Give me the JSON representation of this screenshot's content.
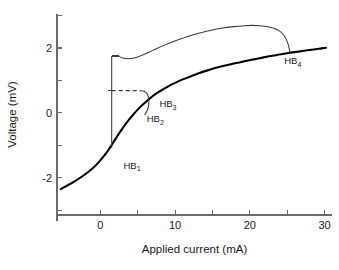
{
  "chart_data": {
    "type": "line",
    "title": "",
    "xlabel": "Applied current (mA)",
    "ylabel": "Voltage (mV)",
    "xlim": [
      -5.8,
      31.0
    ],
    "ylim": [
      -3.15,
      3.05
    ],
    "xticks": [
      0,
      5,
      10,
      15,
      20,
      25,
      30
    ],
    "xtick_labels": [
      "0",
      "",
      "10",
      "",
      "20",
      "",
      "30"
    ],
    "yticks": [
      -3,
      -2,
      -1,
      0,
      1,
      2,
      3
    ],
    "ytick_labels": [
      "",
      "-2",
      "",
      "0",
      "",
      "2",
      ""
    ],
    "grid": false,
    "legend": null,
    "series": [
      {
        "name": "steady-state branch",
        "style": "thick-solid",
        "points": [
          [
            -5.3,
            -2.35
          ],
          [
            -4.5,
            -2.25
          ],
          [
            -3.5,
            -2.12
          ],
          [
            -2.5,
            -1.97
          ],
          [
            -1.5,
            -1.8
          ],
          [
            -0.5,
            -1.59
          ],
          [
            0.3,
            -1.38
          ],
          [
            1.0,
            -1.17
          ],
          [
            1.6,
            -0.96
          ],
          [
            2.2,
            -0.74
          ],
          [
            2.9,
            -0.5
          ],
          [
            3.6,
            -0.28
          ],
          [
            4.3,
            -0.08
          ],
          [
            5.0,
            0.1
          ],
          [
            5.8,
            0.28
          ],
          [
            6.6,
            0.44
          ],
          [
            7.5,
            0.6
          ],
          [
            8.5,
            0.74
          ],
          [
            9.5,
            0.87
          ],
          [
            10.5,
            0.98
          ],
          [
            11.8,
            1.1
          ],
          [
            13.0,
            1.21
          ],
          [
            14.5,
            1.32
          ],
          [
            16.0,
            1.42
          ],
          [
            17.5,
            1.5
          ],
          [
            19.0,
            1.58
          ],
          [
            20.5,
            1.65
          ],
          [
            22.0,
            1.72
          ],
          [
            23.5,
            1.78
          ],
          [
            25.0,
            1.84
          ],
          [
            26.5,
            1.89
          ],
          [
            28.0,
            1.94
          ],
          [
            29.3,
            1.98
          ],
          [
            30.2,
            2.01
          ]
        ]
      },
      {
        "name": "upper periodic branch",
        "style": "thin-solid",
        "points": [
          [
            2.45,
            1.755
          ],
          [
            2.9,
            1.7
          ],
          [
            3.4,
            1.675
          ],
          [
            4.0,
            1.675
          ],
          [
            4.8,
            1.71
          ],
          [
            5.6,
            1.78
          ],
          [
            6.5,
            1.87
          ],
          [
            7.5,
            1.98
          ],
          [
            8.6,
            2.09
          ],
          [
            9.8,
            2.2
          ],
          [
            11.0,
            2.3
          ],
          [
            12.3,
            2.4
          ],
          [
            13.7,
            2.49
          ],
          [
            15.0,
            2.56
          ],
          [
            16.4,
            2.62
          ],
          [
            17.8,
            2.66
          ],
          [
            19.2,
            2.69
          ],
          [
            20.3,
            2.7
          ],
          [
            21.4,
            2.69
          ],
          [
            22.4,
            2.66
          ],
          [
            23.3,
            2.6
          ],
          [
            24.0,
            2.52
          ],
          [
            24.5,
            2.41
          ],
          [
            24.9,
            2.26
          ],
          [
            25.15,
            2.1
          ],
          [
            25.3,
            1.96
          ],
          [
            25.35,
            1.86
          ]
        ]
      },
      {
        "name": "lower periodic loop",
        "style": "thin-solid",
        "points": [
          [
            5.35,
            0.685
          ],
          [
            5.75,
            0.675
          ],
          [
            6.05,
            0.64
          ],
          [
            6.3,
            0.57
          ],
          [
            6.45,
            0.47
          ],
          [
            6.5,
            0.36
          ],
          [
            6.47,
            0.24
          ],
          [
            6.35,
            0.12
          ],
          [
            6.15,
            0.02
          ],
          [
            5.95,
            -0.06
          ]
        ]
      },
      {
        "name": "unstable vertical branch",
        "style": "vertical",
        "points": [
          [
            1.52,
            -1.08
          ],
          [
            1.52,
            1.755
          ]
        ]
      },
      {
        "name": "saddle-node dashed connector",
        "style": "dashed",
        "points": [
          [
            1.52,
            0.685
          ],
          [
            5.35,
            0.685
          ]
        ]
      }
    ],
    "stubs": [
      {
        "name": "upper-stub",
        "x0": 1.52,
        "x1": 2.45,
        "y": 1.755
      },
      {
        "name": "mid-stub",
        "x0": 1.0,
        "x1": 1.52,
        "y": 0.685
      }
    ],
    "annotations": [
      {
        "name": "HB1",
        "base": "HB",
        "sub": "1",
        "x": 3.1,
        "y": -1.72
      },
      {
        "name": "HB2",
        "base": "HB",
        "sub": "2",
        "x": 6.2,
        "y": -0.28
      },
      {
        "name": "HB3",
        "base": "HB",
        "sub": "3",
        "x": 7.9,
        "y": 0.17
      },
      {
        "name": "HB4",
        "base": "HB",
        "sub": "4",
        "x": 24.6,
        "y": 1.5
      }
    ]
  },
  "colors": {
    "background": "#ffffff",
    "axis": "#6b6b6b",
    "main_curve": "#000000",
    "thin_curve": "#3a3a3a",
    "text": "#1a1a1a"
  }
}
